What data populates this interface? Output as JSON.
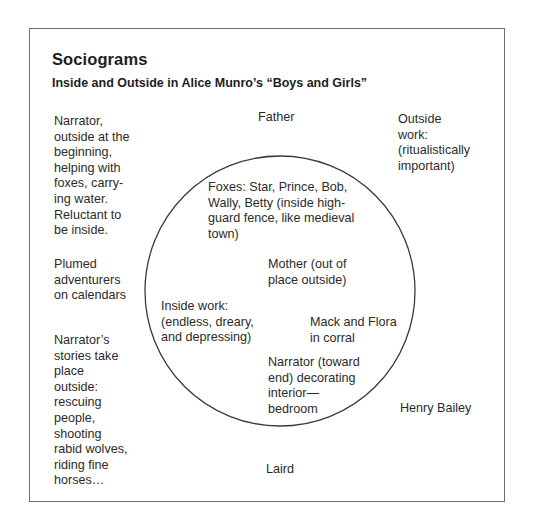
{
  "header": {
    "title": "Sociograms",
    "subtitle": "Inside and Outside in Alice Munro’s “Boys and Girls”"
  },
  "diagram": {
    "type": "sociogram",
    "circle": {
      "meaning": "inside",
      "center_x": 280,
      "center_y": 291,
      "radius": 135,
      "stroke_color": "#3a3a3a"
    },
    "border_color": "#6e6e6e",
    "outside_labels": {
      "narrator_outside": "Narrator,\noutside at the\nbeginning,\nhelping with\nfoxes, carry-\ning water.\nReluctant to\nbe inside.",
      "father": "Father",
      "outside_work": "Outside\nwork:\n(ritualistically\nimportant)",
      "plumed_adventurers": "Plumed\nadventurers\non calendars",
      "narrator_stories": "Narrator’s\nstories take\nplace\noutside:\nrescuing\npeople,\nshooting\nrabid wolves,\nriding fine\nhorses…",
      "henry_bailey": "Henry Bailey",
      "laird": "Laird"
    },
    "inside_labels": {
      "foxes": "Foxes: Star, Prince, Bob,\nWally, Betty (inside high-\nguard fence, like medieval\ntown)",
      "mother": "Mother (out of\nplace outside)",
      "inside_work": "Inside work:\n(endless, dreary,\nand depressing)",
      "mack_flora": "Mack and Flora\nin corral",
      "narrator_end": "Narrator (toward\nend) decorating\ninterior—\nbedroom"
    }
  }
}
